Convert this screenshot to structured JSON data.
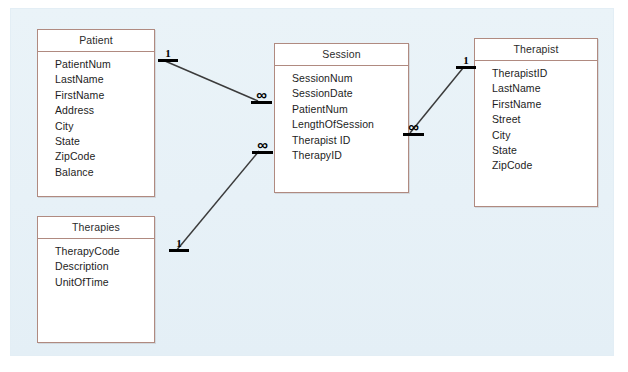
{
  "diagram": {
    "type": "entity-relationship-diagram",
    "canvas_background": "#e9f2f7",
    "entity_border_color": "#b08a80",
    "entity_fill_color": "#ffffff",
    "line_color": "#3a3a3a",
    "entities": [
      {
        "id": "patient",
        "title": "Patient",
        "fields": [
          "PatientNum",
          "LastName",
          "FirstName",
          "Address",
          "City",
          "State",
          "ZipCode",
          "Balance"
        ]
      },
      {
        "id": "session",
        "title": "Session",
        "fields": [
          "SessionNum",
          "SessionDate",
          "PatientNum",
          "LengthOfSession",
          "Therapist ID",
          "TherapyID"
        ]
      },
      {
        "id": "therapist",
        "title": "Therapist",
        "fields": [
          "TherapistID",
          "LastName",
          "FirstName",
          "Street",
          "City",
          "State",
          "ZipCode"
        ]
      },
      {
        "id": "therapies",
        "title": "Therapies",
        "fields": [
          "TherapyCode",
          "Description",
          "UnitOfTime"
        ]
      }
    ],
    "relationships": [
      {
        "id": "patient-session",
        "from": "patient",
        "to": "session",
        "from_cardinality": "1",
        "to_cardinality": "∞"
      },
      {
        "id": "therapist-session",
        "from": "therapist",
        "to": "session",
        "from_cardinality": "1",
        "to_cardinality": "∞"
      },
      {
        "id": "therapies-session",
        "from": "therapies",
        "to": "session",
        "from_cardinality": "1",
        "to_cardinality": "∞"
      }
    ]
  }
}
